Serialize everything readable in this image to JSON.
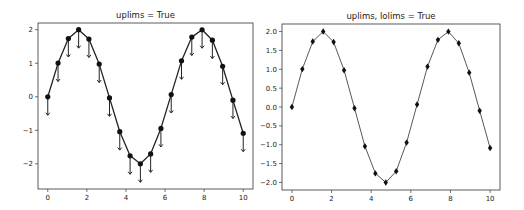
{
  "figure": {
    "width": 524,
    "height": 210,
    "background": "#ffffff"
  },
  "chart_data": [
    {
      "type": "line",
      "title": "uplims = True",
      "xlabel": "",
      "ylabel": "",
      "frame": {
        "left": 38,
        "top": 23,
        "right": 253,
        "bottom": 189
      },
      "xlim": [
        -0.5,
        10.5
      ],
      "ylim": [
        -2.75,
        2.2
      ],
      "xticks": [
        0,
        2,
        4,
        6,
        8,
        10
      ],
      "xtick_labels": [
        "0",
        "2",
        "4",
        "6",
        "8",
        "10"
      ],
      "yticks": [
        -2,
        -1,
        0,
        1,
        2
      ],
      "ytick_labels": [
        "−2",
        "−1",
        "0",
        "1",
        "2"
      ],
      "grid": false,
      "legend": null,
      "error_style": "upper limits (downward arrows)",
      "yerr": 0.55,
      "line_color": "#222222",
      "line_width": 1.3,
      "marker": "circle",
      "series": [
        {
          "name": "2*sin(x)",
          "x": [
            0.0,
            0.526,
            1.053,
            1.579,
            2.105,
            2.632,
            3.158,
            3.684,
            4.211,
            4.737,
            5.263,
            5.789,
            6.316,
            6.842,
            7.368,
            7.895,
            8.421,
            8.947,
            9.474,
            10.0
          ],
          "y": [
            0.0,
            1.004,
            1.737,
            2.0,
            1.722,
            0.974,
            -0.033,
            -1.04,
            -1.76,
            -2.0,
            -1.703,
            -0.943,
            0.066,
            1.071,
            1.78,
            1.998,
            1.688,
            0.91,
            -0.1,
            -1.088
          ]
        }
      ]
    },
    {
      "type": "line",
      "title": "uplims, lolims = True",
      "xlabel": "",
      "ylabel": "",
      "frame": {
        "left": 282,
        "top": 24,
        "right": 500,
        "bottom": 190
      },
      "xlim": [
        -0.5,
        10.5
      ],
      "ylim": [
        -2.2,
        2.2
      ],
      "xticks": [
        0,
        2,
        4,
        6,
        8,
        10
      ],
      "xtick_labels": [
        "0",
        "2",
        "4",
        "6",
        "8",
        "10"
      ],
      "yticks": [
        -2.0,
        -1.5,
        -1.0,
        -0.5,
        0.0,
        0.5,
        1.0,
        1.5,
        2.0
      ],
      "ytick_labels": [
        "−2.0",
        "−1.5",
        "−1.0",
        "−0.5",
        "0.0",
        "0.5",
        "1.0",
        "1.5",
        "2.0"
      ],
      "grid": false,
      "legend": null,
      "error_style": "upper and lower limits (tiny arrows at markers)",
      "yerr": 0.0,
      "line_color": "#444444",
      "line_width": 0.9,
      "marker": "diamond",
      "series": [
        {
          "name": "2*sin(x)",
          "x": [
            0.0,
            0.526,
            1.053,
            1.579,
            2.105,
            2.632,
            3.158,
            3.684,
            4.211,
            4.737,
            5.263,
            5.789,
            6.316,
            6.842,
            7.368,
            7.895,
            8.421,
            8.947,
            9.474,
            10.0
          ],
          "y": [
            0.0,
            1.004,
            1.737,
            2.0,
            1.722,
            0.974,
            -0.033,
            -1.04,
            -1.76,
            -2.0,
            -1.703,
            -0.943,
            0.066,
            1.071,
            1.78,
            1.998,
            1.688,
            0.91,
            -0.1,
            -1.088
          ]
        }
      ]
    }
  ]
}
